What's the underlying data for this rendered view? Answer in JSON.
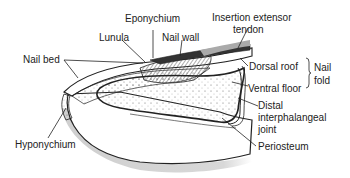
{
  "diagram": {
    "labels": {
      "eponychium": "Eponychium",
      "insertion_line1": "Insertion extensor",
      "insertion_line2": "tendon",
      "lunula": "Lunula",
      "nail_wall": "Nail wall",
      "nail_bed": "Nail bed",
      "dorsal_roof": "Dorsal roof",
      "ventral_floor": "Ventral floor",
      "nail_fold_line1": "Nail",
      "nail_fold_line2": "fold",
      "distal_line1": "Distal",
      "distal_line2": "interphalangeal",
      "distal_line3": "joint",
      "hyponychium": "Hyponychium",
      "periosteum": "Periosteum"
    },
    "colors": {
      "ink": "#222222",
      "soft_tissue": "#ffffff",
      "shading": "#d6d6d6",
      "bone": "#f4f4f4"
    }
  }
}
